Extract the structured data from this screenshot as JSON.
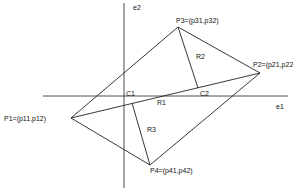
{
  "diagram": {
    "axes": {
      "e1": {
        "label": "e1",
        "x1": 43,
        "y1": 96,
        "x2": 288,
        "y2": 96,
        "label_x": 276,
        "label_y": 109
      },
      "e2": {
        "label": "e2",
        "x1": 124,
        "y1": 3,
        "x2": 124,
        "y2": 188,
        "label_x": 133,
        "label_y": 10
      }
    },
    "points": {
      "P1": {
        "label": "P1=(p11,p12)",
        "x": 71,
        "y": 118,
        "label_x": 4,
        "label_y": 121
      },
      "P2": {
        "label": "P2=(p21,p22)",
        "x": 260,
        "y": 73,
        "label_x": 253,
        "label_y": 67
      },
      "P3": {
        "label": "P3=(p31,p32)",
        "x": 178,
        "y": 27,
        "label_x": 176,
        "label_y": 23
      },
      "P4": {
        "label": "P4=(p41,p42)",
        "x": 150,
        "y": 165,
        "label_x": 150,
        "label_y": 173
      }
    },
    "centroids": {
      "C1": {
        "label": "C1",
        "x": 127,
        "y": 96,
        "label_x": 126,
        "label_y": 96
      },
      "C2": {
        "label": "C2",
        "x": 198,
        "y": 88,
        "label_x": 200,
        "label_y": 96
      }
    },
    "regions": {
      "R1": {
        "label": "R1",
        "label_x": 157,
        "label_y": 105
      },
      "R2": {
        "label": "R2",
        "label_x": 196,
        "label_y": 59
      },
      "R3": {
        "label": "R3",
        "label_x": 147,
        "label_y": 132
      }
    },
    "segments": [
      {
        "name": "edge-p1-p3",
        "x1": 71,
        "y1": 118,
        "x2": 178,
        "y2": 27
      },
      {
        "name": "edge-p3-p2",
        "x1": 178,
        "y1": 27,
        "x2": 260,
        "y2": 73
      },
      {
        "name": "edge-p2-p4",
        "x1": 260,
        "y1": 73,
        "x2": 150,
        "y2": 165
      },
      {
        "name": "edge-p4-p1",
        "x1": 150,
        "y1": 165,
        "x2": 71,
        "y2": 118
      },
      {
        "name": "diagonal-p1-p2",
        "x1": 71,
        "y1": 118,
        "x2": 260,
        "y2": 73
      },
      {
        "name": "perpendicular-p3-c2",
        "x1": 178,
        "y1": 27,
        "x2": 198,
        "y2": 88
      },
      {
        "name": "perpendicular-p4-diagonal",
        "x1": 150,
        "y1": 165,
        "x2": 132,
        "y2": 103
      }
    ],
    "stroke_color": "#222222"
  }
}
